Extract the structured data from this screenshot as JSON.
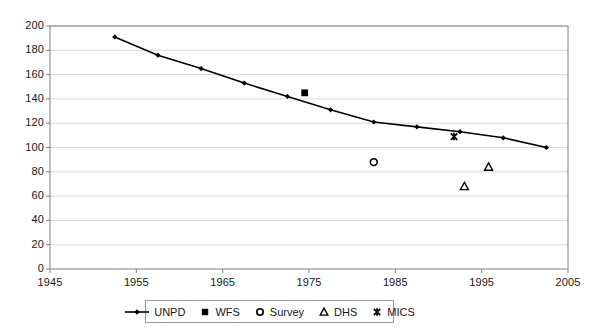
{
  "chart_data": {
    "type": "scatter",
    "title": "",
    "xlabel": "",
    "ylabel": "",
    "xlim": [
      1945,
      2005
    ],
    "ylim": [
      0,
      200
    ],
    "xticks": [
      1945,
      1955,
      1965,
      1975,
      1985,
      1995,
      2005
    ],
    "yticks": [
      0,
      20,
      40,
      60,
      80,
      100,
      120,
      140,
      160,
      180,
      200
    ],
    "grid": true,
    "legend_position": "bottom",
    "series": [
      {
        "name": "UNPD",
        "marker": "line-diamond",
        "x": [
          1952.5,
          1957.5,
          1962.5,
          1967.5,
          1972.5,
          1977.5,
          1982.5,
          1987.5,
          1992.5,
          1997.5,
          2002.5
        ],
        "values": [
          191,
          176,
          165,
          153,
          142,
          131,
          121,
          117,
          113,
          108,
          100
        ]
      },
      {
        "name": "WFS",
        "marker": "filled-square",
        "x": [
          1974.5
        ],
        "values": [
          145
        ]
      },
      {
        "name": "Survey",
        "marker": "open-circle",
        "x": [
          1982.5
        ],
        "values": [
          88
        ]
      },
      {
        "name": "DHS",
        "marker": "open-triangle",
        "x": [
          1993,
          1995.8
        ],
        "values": [
          68,
          84
        ]
      },
      {
        "name": "MICS",
        "marker": "cross-star",
        "x": [
          1991.8
        ],
        "values": [
          109
        ]
      }
    ]
  },
  "legend": {
    "items": [
      {
        "label": "UNPD",
        "marker": "line-diamond"
      },
      {
        "label": "WFS",
        "marker": "filled-square"
      },
      {
        "label": "Survey",
        "marker": "open-circle"
      },
      {
        "label": "DHS",
        "marker": "open-triangle"
      },
      {
        "label": "MICS",
        "marker": "cross-star"
      }
    ]
  },
  "colors": {
    "series": "#000000",
    "axis": "#808080",
    "grid": "#d9d9d9",
    "background": "#ffffff",
    "text": "#161616"
  }
}
